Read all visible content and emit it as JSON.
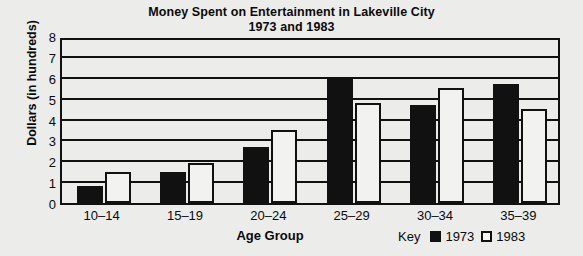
{
  "chart_data": {
    "type": "bar",
    "title": "Money Spent on Entertainment in Lakeville City",
    "subtitle": "1973 and 1983",
    "xlabel": "Age Group",
    "ylabel": "Dollars (in hundreds)",
    "categories": [
      "10–14",
      "15–19",
      "20–24",
      "25–29",
      "30–34",
      "35–39"
    ],
    "series": [
      {
        "name": "1973",
        "values": [
          0.8,
          1.5,
          2.7,
          6.0,
          4.7,
          5.7
        ],
        "color": "#111111",
        "style": "filled"
      },
      {
        "name": "1983",
        "values": [
          1.5,
          1.9,
          3.5,
          4.8,
          5.5,
          4.5
        ],
        "color": "#f2f2f0",
        "style": "hollow"
      }
    ],
    "ylim": [
      0,
      8
    ],
    "yticks": [
      0,
      1,
      2,
      3,
      4,
      5,
      6,
      7,
      8
    ],
    "ytick_labels": [
      "0",
      "1",
      "2",
      "3",
      "4",
      "5",
      "6",
      "7",
      "8"
    ],
    "grid": true,
    "grid_axis": "y",
    "legend": {
      "key_label": "Key",
      "position": "bottom-right",
      "entries": [
        "1973",
        "1983"
      ]
    }
  }
}
